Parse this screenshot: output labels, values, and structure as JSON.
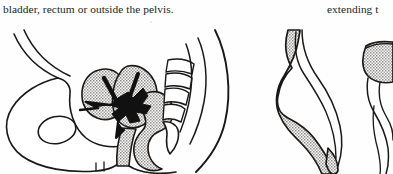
{
  "page": {
    "kind": "scanned-textbook-page-fragment",
    "background_color": "#fefefe",
    "ink_color": "#201e1d",
    "gray_fill_color": "#c9c6c4",
    "width_px": 393,
    "height_px": 174
  },
  "text": {
    "left_column_line": "bladder, rectum or outside the pelvis.",
    "right_column_line": "extending t"
  },
  "figures": [
    {
      "id": "fig-pelvis",
      "name": "sagittal-pelvis-diagram",
      "description": "Mid-sagittal line drawing of the female pelvis showing the pubic bone with obturator foramen, bladder, uterus with a solid black tumour mass, vagina, rectum, sacrum, coccyx and posterior body wall outline",
      "parts": [
        "pelvic-bone",
        "obturator-foramen",
        "bladder",
        "uterus",
        "tumour-mass",
        "vagina",
        "rectum",
        "sacrum",
        "coccyx",
        "body-outline"
      ]
    },
    {
      "id": "fig-detail",
      "name": "detail-diagram",
      "description": "Partially cropped companion line drawing of an elongated shaded anatomical structure tapering downward, with a second cropped structure at the right page edge",
      "parts": [
        "primary-shaded-structure",
        "secondary-cropped-structure"
      ]
    }
  ]
}
